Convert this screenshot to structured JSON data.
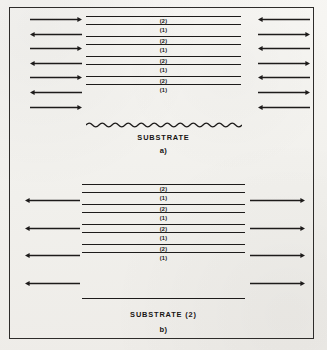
{
  "figure": {
    "background_color": "#f4f3f0",
    "ink_color": "#1d1b1a",
    "border_color": "#2e2c2a"
  },
  "panels": [
    {
      "id": "a",
      "panel_label": "a)",
      "substrate_label": "SUBSTRATE",
      "substrate_boundary": "wavy",
      "layers": [
        {
          "label": "(2)",
          "kind": "thin"
        },
        {
          "label": "(1)",
          "kind": "gap"
        },
        {
          "label": "(2)",
          "kind": "thin"
        },
        {
          "label": "(1)",
          "kind": "gap"
        },
        {
          "label": "(2)",
          "kind": "thin"
        },
        {
          "label": "(1)",
          "kind": "gap"
        },
        {
          "label": "(2)",
          "kind": "thin"
        },
        {
          "label": "(1)",
          "kind": "gap"
        }
      ],
      "left_arrows": [
        "right",
        "left",
        "right",
        "left",
        "right",
        "left",
        "right"
      ],
      "right_arrows": [
        "left",
        "right",
        "left",
        "right",
        "left",
        "right",
        "left"
      ]
    },
    {
      "id": "b",
      "panel_label": "b)",
      "substrate_label": "SUBSTRATE  (2)",
      "substrate_boundary": "straight",
      "layers": [
        {
          "label": "(2)",
          "kind": "thin"
        },
        {
          "label": "(1)",
          "kind": "gap"
        },
        {
          "label": "(2)",
          "kind": "thin"
        },
        {
          "label": "(1)",
          "kind": "gap"
        },
        {
          "label": "(2)",
          "kind": "thin"
        },
        {
          "label": "(1)",
          "kind": "gap"
        },
        {
          "label": "(2)",
          "kind": "thin"
        },
        {
          "label": "(1)",
          "kind": "gap"
        }
      ],
      "left_arrows": [
        "left",
        "left",
        "left",
        "left"
      ],
      "right_arrows": [
        "right",
        "right",
        "right",
        "right"
      ]
    }
  ]
}
